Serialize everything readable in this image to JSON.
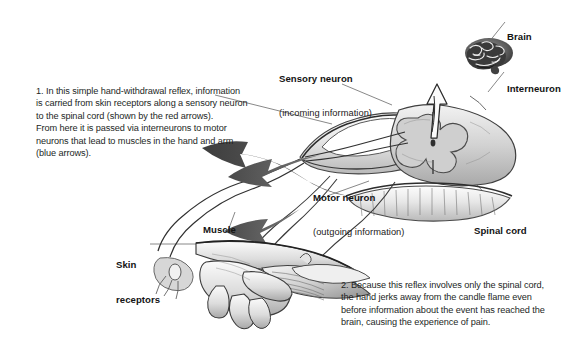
{
  "figure": {
    "background_color": "#ffffff",
    "text_color": "#231f1e",
    "arrow_colors": {
      "motor_arrow_gray": "#595959",
      "sensory_arrow_red": "#8d8d8d",
      "ascending_arrow_outline": "#2a2a2a"
    }
  },
  "paragraphs": {
    "one": "1. In this simple hand-withdrawal reflex, information\nis carried from skin receptors along a sensory neuron\nto the spinal cord (shown by the red arrows).\nFrom here it is passed via interneurons to motor\nneurons that lead to muscles in the hand and arm\n(blue arrows).",
    "two": "2. Because this reflex involves only the spinal cord,\nthe hand jerks away from the candle flame even\nbefore information about the event has reached the\nbrain, causing the experience of pain."
  },
  "labels": {
    "sensory_neuron": "Sensory neuron",
    "sensory_neuron_sub": "(incoming information)",
    "motor_neuron": "Motor neuron",
    "motor_neuron_sub": "(outgoing information)",
    "brain": "Brain",
    "interneuron": "Interneuron",
    "spinal_cord": "Spinal cord",
    "muscle": "Muscle",
    "skin_receptors_line1": "Skin",
    "skin_receptors_line2": "receptors"
  },
  "illustration_parts": [
    "brain-illustration",
    "spinal-cord-cross-section",
    "vertebra-illustration",
    "forearm-and-hand-illustration",
    "candle-illustration",
    "sensory-nerve-pathway",
    "motor-nerve-pathway",
    "ascending-pathway-arrow"
  ]
}
